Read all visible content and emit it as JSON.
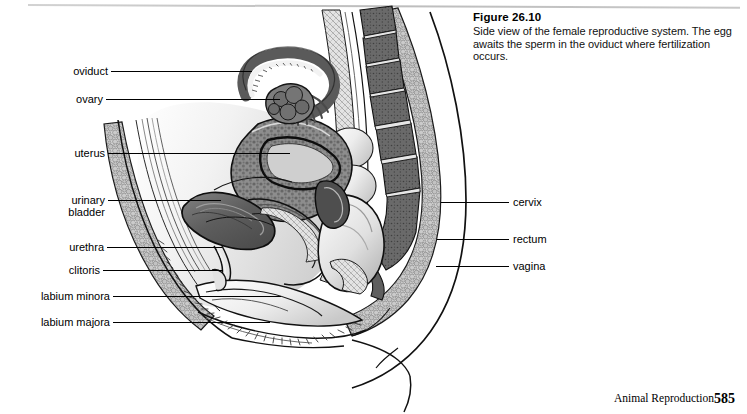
{
  "figure": {
    "title": "Figure 26.10",
    "caption_line1": "Side view of the female reproductive system. The egg",
    "caption_line2": "awaits the sperm in the oviduct where fertilization occurs."
  },
  "labels_left": [
    {
      "text": "oviduct",
      "text2": ""
    },
    {
      "text": "ovary",
      "text2": ""
    },
    {
      "text": "uterus",
      "text2": ""
    },
    {
      "text": "urinary",
      "text2": "bladder"
    },
    {
      "text": "urethra",
      "text2": ""
    },
    {
      "text": "clitoris",
      "text2": ""
    },
    {
      "text": "labium minora",
      "text2": ""
    },
    {
      "text": "labium majora",
      "text2": ""
    }
  ],
  "labels_right": [
    {
      "text": "cervix"
    },
    {
      "text": "rectum"
    },
    {
      "text": "vagina"
    }
  ],
  "footer": {
    "chapter_title": "Animal Reproduction",
    "page_number": "585"
  },
  "colors": {
    "ink": "#000000",
    "page_background": "#ffffff",
    "rule": "#c4c4c4",
    "tissue_light": "#d9d9d9",
    "tissue_mid": "#a8a8a8",
    "tissue_dark": "#6e6e6e",
    "organ_dark": "#5a5a5a",
    "bone": "#7a7a7a"
  }
}
